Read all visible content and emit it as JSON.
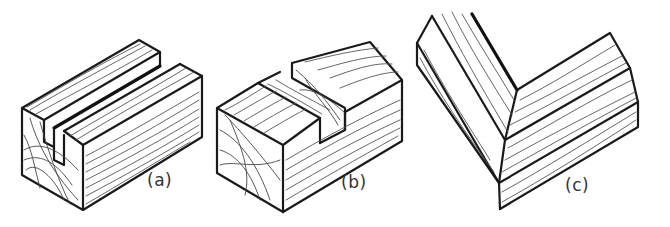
{
  "figure": {
    "panels": [
      {
        "id": "a",
        "label": "(a)",
        "subject": "block with groove (housing) cut along length"
      },
      {
        "id": "b",
        "label": "(b)",
        "subject": "block with cross-grain housing / dado cut"
      },
      {
        "id": "c",
        "label": "(c)",
        "subject": "rebated corner joint (L-shape)"
      }
    ]
  },
  "colors": {
    "background": "#ffffff",
    "line": "#1a1a1a",
    "grain": "#555555"
  }
}
